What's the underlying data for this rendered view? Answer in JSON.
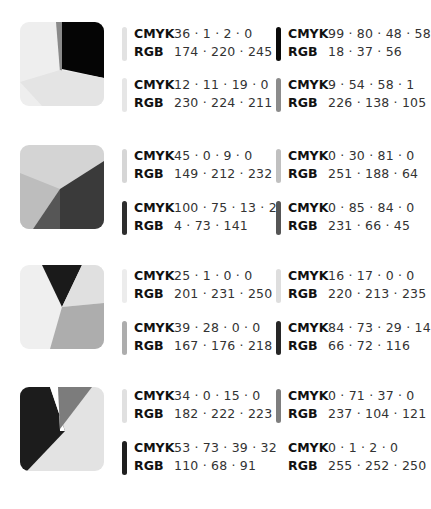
{
  "palettes": [
    {
      "swatch": {
        "colors": [
          "#eeeeee",
          "#8a8a8a",
          "#050505",
          "#e4e4e4"
        ]
      },
      "entries": [
        {
          "bar": "#e2e2e2",
          "cmyk_label": "CMYK",
          "cmyk": "36 · 1 · 2 · 0",
          "rgb_label": "RGB",
          "rgb": "174 · 220 · 245"
        },
        {
          "bar": "#0a0a0a",
          "cmyk_label": "CMYK",
          "cmyk": "99 · 80 · 48 · 58",
          "rgb_label": "RGB",
          "rgb": "18 · 37 · 56"
        },
        {
          "bar": "#e6e6e6",
          "cmyk_label": "CMYK",
          "cmyk": "12 · 11 · 19 · 0",
          "rgb_label": "RGB",
          "rgb": "230 · 224 · 211"
        },
        {
          "bar": "#8c8c8c",
          "cmyk_label": "CMYK",
          "cmyk": "9 · 54 · 58 · 1",
          "rgb_label": "RGB",
          "rgb": "226 · 138 · 105"
        }
      ]
    },
    {
      "swatch": {
        "colors": [
          "#d4d4d4",
          "#bdbdbd",
          "#3a3a3a",
          "#565656"
        ]
      },
      "entries": [
        {
          "bar": "#d6d6d6",
          "cmyk_label": "CMYK",
          "cmyk": "45 · 0 · 9 · 0",
          "rgb_label": "RGB",
          "rgb": "149 · 212 · 232"
        },
        {
          "bar": "#c0c0c0",
          "cmyk_label": "CMYK",
          "cmyk": "0 · 30 · 81 · 0",
          "rgb_label": "RGB",
          "rgb": "251 · 188 · 64"
        },
        {
          "bar": "#2e2e2e",
          "cmyk_label": "CMYK",
          "cmyk": "100 · 75 · 13 · 2",
          "rgb_label": "RGB",
          "rgb": "4 · 73 · 141"
        },
        {
          "bar": "#555555",
          "cmyk_label": "CMYK",
          "cmyk": "0 · 85 · 84 · 0",
          "rgb_label": "RGB",
          "rgb": "231 · 66 · 45"
        }
      ]
    },
    {
      "swatch": {
        "colors": [
          "#efefef",
          "#1a1a1a",
          "#e0e0e0",
          "#adadad"
        ]
      },
      "entries": [
        {
          "bar": "#ececec",
          "cmyk_label": "CMYK",
          "cmyk": "25 · 1 · 0 · 0",
          "rgb_label": "RGB",
          "rgb": "201 · 231 · 250"
        },
        {
          "bar": "#dedede",
          "cmyk_label": "CMYK",
          "cmyk": "16 · 17 · 0 · 0",
          "rgb_label": "RGB",
          "rgb": "220 · 213 · 235"
        },
        {
          "bar": "#adadad",
          "cmyk_label": "CMYK",
          "cmyk": "39 · 28 · 0 · 0",
          "rgb_label": "RGB",
          "rgb": "167 · 176 · 218"
        },
        {
          "bar": "#262626",
          "cmyk_label": "CMYK",
          "cmyk": "84 · 73 · 29 · 14",
          "rgb_label": "RGB",
          "rgb": "66 · 72 · 116"
        }
      ]
    },
    {
      "swatch": {
        "colors": [
          "#1c1c1c",
          "#ffffff",
          "#7c7c7c",
          "#e3e3e3"
        ]
      },
      "entries": [
        {
          "bar": "#e0e0e0",
          "cmyk_label": "CMYK",
          "cmyk": "34 · 0 · 15 · 0",
          "rgb_label": "RGB",
          "rgb": "182 · 222 · 223"
        },
        {
          "bar": "#7e7e7e",
          "cmyk_label": "CMYK",
          "cmyk": "0 · 71 · 37 · 0",
          "rgb_label": "RGB",
          "rgb": "237 · 104 · 121"
        },
        {
          "bar": "#1f1f1f",
          "cmyk_label": "CMYK",
          "cmyk": "53 · 73 · 39 · 32",
          "rgb_label": "RGB",
          "rgb": "110 · 68 · 91"
        },
        {
          "bar": "#ffffff",
          "cmyk_label": "CMYK",
          "cmyk": "0 · 1 · 2 · 0",
          "rgb_label": "RGB",
          "rgb": "255 · 252 · 250"
        }
      ]
    }
  ]
}
